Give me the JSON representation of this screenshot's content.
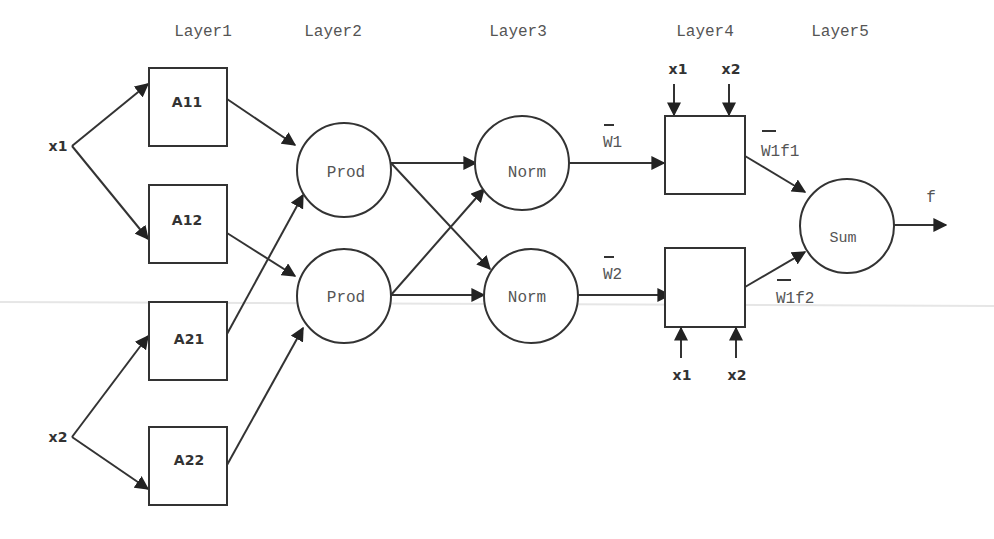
{
  "diagram": {
    "type": "ANFIS network architecture",
    "layers": [
      {
        "id": "layer1",
        "label": "Layer1"
      },
      {
        "id": "layer2",
        "label": "Layer2"
      },
      {
        "id": "layer3",
        "label": "Layer3"
      },
      {
        "id": "layer4",
        "label": "Layer4"
      },
      {
        "id": "layer5",
        "label": "Layer5"
      }
    ],
    "inputs": {
      "x1": "x1",
      "x2": "x2"
    },
    "layer1_nodes": [
      "A11",
      "A12",
      "A21",
      "A22"
    ],
    "layer2_nodes": [
      "Prod",
      "Prod"
    ],
    "layer3_nodes": [
      "Norm",
      "Norm"
    ],
    "layer3_outputs": [
      "W1",
      "W2"
    ],
    "layer4_inputs": {
      "top": [
        "x1",
        "x2"
      ],
      "bottom": [
        "x1",
        "x2"
      ]
    },
    "layer4_outputs": [
      "W1f1",
      "W1f2"
    ],
    "layer5_node": "Sum",
    "output": "f",
    "edges": [
      [
        "x1",
        "A11"
      ],
      [
        "x1",
        "A12"
      ],
      [
        "x2",
        "A21"
      ],
      [
        "x2",
        "A22"
      ],
      [
        "A11",
        "Prod1"
      ],
      [
        "A21",
        "Prod1"
      ],
      [
        "A12",
        "Prod2"
      ],
      [
        "A22",
        "Prod2"
      ],
      [
        "Prod1",
        "Norm1"
      ],
      [
        "Prod1",
        "Norm2"
      ],
      [
        "Prod2",
        "Norm1"
      ],
      [
        "Prod2",
        "Norm2"
      ],
      [
        "Norm1",
        "L4box1"
      ],
      [
        "Norm2",
        "L4box2"
      ],
      [
        "L4box1",
        "Sum"
      ],
      [
        "L4box2",
        "Sum"
      ],
      [
        "Sum",
        "f"
      ]
    ]
  }
}
